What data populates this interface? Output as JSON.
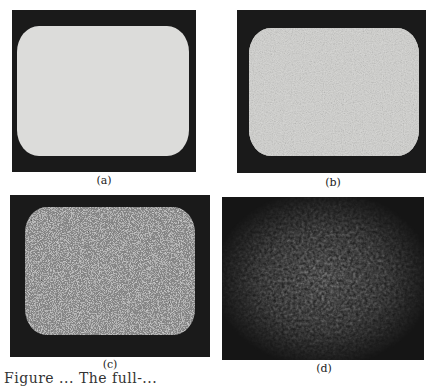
{
  "figure": {
    "panels": [
      {
        "id": "a",
        "label": "(a)",
        "description": "blank bright screen, uniform light gray"
      },
      {
        "id": "b",
        "label": "(b)",
        "description": "fine gray noise on bright screen"
      },
      {
        "id": "c",
        "label": "(c)",
        "description": "strong black-and-white speckle noise"
      },
      {
        "id": "d",
        "label": "(d)",
        "description": "dim blurred noise with dark vignette"
      }
    ],
    "caption": "Figure ... The full-..."
  }
}
